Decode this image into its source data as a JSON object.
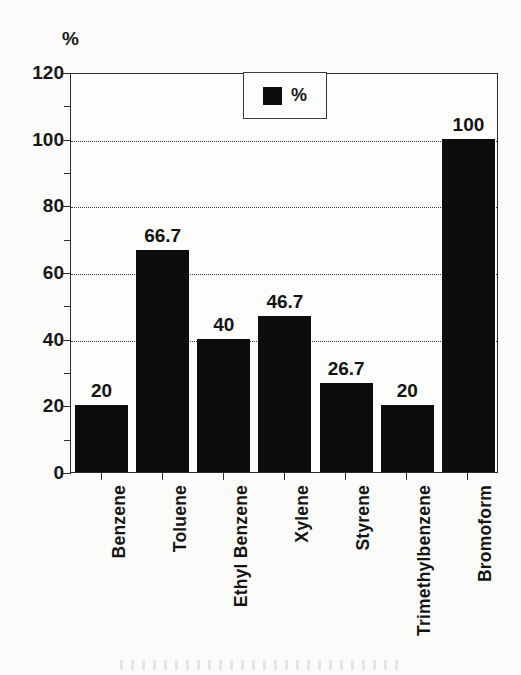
{
  "chart_data": {
    "type": "bar",
    "title": "",
    "xlabel": "",
    "ylabel": "%",
    "ylim": [
      0,
      120
    ],
    "ytick_step": 20,
    "yminor_step": 10,
    "grid": true,
    "grid_values": [
      40,
      60,
      80,
      100
    ],
    "legend": {
      "position": "top-center",
      "entries": [
        {
          "name": "%",
          "color": "#0d0d0d"
        }
      ]
    },
    "categories": [
      "Benzene",
      "Toluene",
      "Ethyl Benzene",
      "Xylene",
      "Styrene",
      "Trimethylbenzene",
      "Bromoform"
    ],
    "values": [
      20,
      66.7,
      40,
      46.7,
      26.7,
      20,
      100
    ],
    "data_labels": [
      "20",
      "66.7",
      "40",
      "46.7",
      "26.7",
      "20",
      "100"
    ],
    "ytick_labels": [
      "0",
      "20",
      "40",
      "60",
      "80",
      "100",
      "120"
    ],
    "ytick_values": [
      0,
      20,
      40,
      60,
      80,
      100,
      120
    ],
    "series": [
      {
        "name": "%",
        "color": "#0d0d0d",
        "values": [
          20,
          66.7,
          40,
          46.7,
          26.7,
          20,
          100
        ]
      }
    ]
  },
  "axis": {
    "y_unit_label": "%"
  },
  "colors": {
    "bar": "#0d0d0d",
    "axis": "#2b2b2b",
    "grid": "#3a3a3a",
    "text": "#141414",
    "background": "#fbfbf9"
  }
}
